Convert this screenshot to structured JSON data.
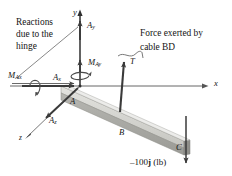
{
  "figure": {
    "type": "free-body-diagram",
    "background": "#ffffff",
    "ink_color": "#2b2b2b",
    "beam_color_top": "#d8d8d4",
    "beam_color_face": "#a9a9a4",
    "annotations": {
      "hinge_note_line1": "Reactions",
      "hinge_note_line2": "due to the",
      "hinge_note_line3": "hinge",
      "cable_note_line1": "Force exerted by",
      "cable_note_line2": "cable BD"
    },
    "axes": {
      "x_label": "x",
      "y_label": "y",
      "z_label": "z"
    },
    "points": {
      "origin": "A",
      "mid": "B",
      "end": "C"
    },
    "vectors": {
      "ax_base": "A",
      "ax_sub": "x",
      "ay_base": "A",
      "ay_sub": "y",
      "az_base": "A",
      "az_sub": "z",
      "max_base": "M",
      "max_sub": "Ax",
      "may_base": "M",
      "may_sub": "Ay",
      "tension": "T"
    },
    "load": {
      "magnitude": "–100",
      "unit_vector": "j",
      "units": "(lb)"
    }
  }
}
